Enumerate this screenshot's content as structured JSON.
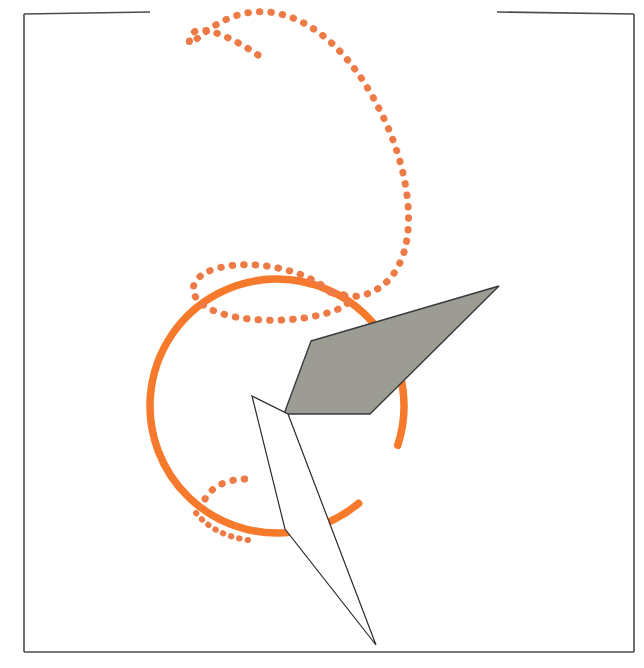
{
  "figure": {
    "canvas": {
      "width": 644,
      "height": 668,
      "background": "#ffffff"
    },
    "colors": {
      "orange": "#F7792B",
      "orange_dot": "#EE7B46",
      "gray_fill": "#9C9C94",
      "gray_stroke": "#3A3A3A",
      "frame_stroke": "#4A4A4A",
      "thin_stroke": "#2B2B2B",
      "background": "#ffffff"
    },
    "frame": {
      "name": "partial-rectangular-border",
      "stroke_width": 1.6,
      "left_edge": {
        "x1": 24,
        "y1": 14,
        "x2": 24,
        "y2": 652
      },
      "right_edge": {
        "x1": 634,
        "y1": 14,
        "x2": 634,
        "y2": 652
      },
      "bottom_edge": {
        "x1": 24,
        "y1": 652,
        "x2": 634,
        "y2": 652
      },
      "top_edge_left_segment": {
        "x1": 24,
        "y1": 14,
        "x2": 150,
        "y2": 12
      },
      "top_edge_right_segment": {
        "x1": 497,
        "y1": 12,
        "x2": 634,
        "y2": 14
      },
      "top_gap": {
        "from_x": 150,
        "to_x": 497
      }
    },
    "shapes": {
      "dotted_spiral": {
        "name": "dotted-spiral-curve",
        "stroke": "#EE7B46",
        "stroke_width": 7,
        "dash_pattern": "0.5 11",
        "path": "M 258 55 C 230 36 194 20 190 38 C 185 58 208 16 254 12 C 300 8 342 44 370 92 C 404 150 416 212 404 252 C 392 292 358 304 330 292",
        "description": "upper open loop that unwinds into a long descending arc ending near the circle top"
      },
      "dotted_loop_lower": {
        "name": "dotted-loop-lower",
        "stroke": "#EE7B46",
        "stroke_width": 7,
        "dash_pattern": "0.5 11",
        "path": "M 330 292 C 310 272 258 258 218 268 C 188 276 186 296 208 308 C 238 324 300 324 336 310 C 356 302 352 294 330 292",
        "description": "small flattened loop crossing the top of the circle"
      },
      "dotted_arc_inner": {
        "name": "dotted-arc-inner",
        "stroke": "#EE7B46",
        "stroke_width": 7,
        "dash_pattern": "0.5 11",
        "path": "M 205 499 C 212 486 228 479 246 479",
        "description": "short dotted arc inside lower-left of circle"
      },
      "dotted_arc_rim": {
        "name": "dotted-arc-rim",
        "stroke": "#EE7B46",
        "stroke_width": 6,
        "dash_pattern": "0.5 8",
        "path": "M 196 513 C 208 528 226 537 248 540",
        "description": "dotted dashes riding along the lower-left rim of the circle"
      },
      "orange_circle": {
        "name": "orange-circle",
        "stroke": "#F7792B",
        "stroke_width": 7.5,
        "center": {
          "cx": 277,
          "cy": 406
        },
        "radius": 127,
        "gap_start_deg": 18,
        "gap_end_deg": 50,
        "description": "large open orange circle with a small gap on the lower right"
      },
      "gray_parallelogram": {
        "name": "gray-plane-parallelogram",
        "fill": "#9C9C94",
        "stroke": "#3A3A3A",
        "stroke_width": 1.4,
        "opacity": 1,
        "points": [
          {
            "x": 311,
            "y": 341
          },
          {
            "x": 499,
            "y": 286
          },
          {
            "x": 370,
            "y": 414
          },
          {
            "x": 284,
            "y": 414
          }
        ],
        "description": "shaded slanted plane passing through the circle"
      },
      "thin_quadrilateral": {
        "name": "thin-outlined-quadrilateral",
        "fill": "#ffffff",
        "stroke": "#2B2B2B",
        "stroke_width": 1.2,
        "points": [
          {
            "x": 252,
            "y": 396
          },
          {
            "x": 288,
            "y": 414
          },
          {
            "x": 376,
            "y": 645
          },
          {
            "x": 285,
            "y": 529
          }
        ],
        "description": "narrow white sliver quadrilateral with sharp apex at the bottom"
      }
    }
  }
}
